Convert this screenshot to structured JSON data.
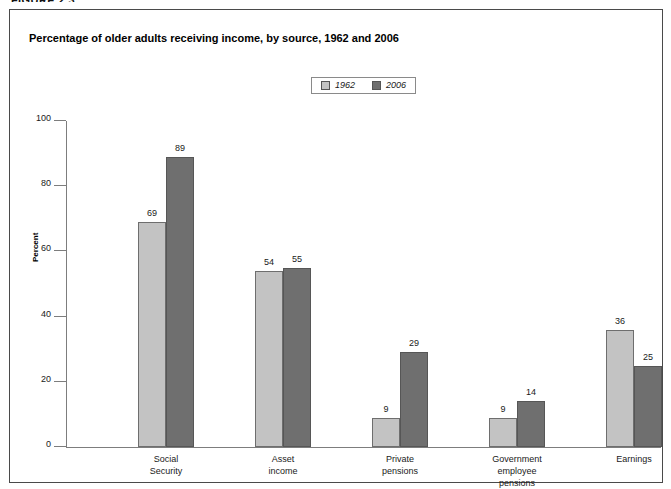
{
  "figure_heading": "FIGURE 2.3",
  "chart_title": "Percentage of older adults receiving income, by source, 1962 and 2006",
  "legend": {
    "entries": [
      {
        "label": "1962",
        "color": "#c3c3c3"
      },
      {
        "label": "2006",
        "color": "#6f6f6f"
      }
    ]
  },
  "chart_data": {
    "type": "bar",
    "title": "Percentage of older adults receiving income, by source, 1962 and 2006",
    "xlabel": "",
    "ylabel": "Percent",
    "ylim": [
      0,
      100
    ],
    "yticks": [
      0,
      20,
      40,
      60,
      80,
      100
    ],
    "grid": false,
    "legend_position": "top-center",
    "categories": [
      "Social Security",
      "Asset income",
      "Private pensions",
      "Government employee pensions",
      "Earnings"
    ],
    "category_lines": [
      [
        "Social",
        "Security"
      ],
      [
        "Asset",
        "income"
      ],
      [
        "Private",
        "pensions"
      ],
      [
        "Government",
        "employee",
        "pensions"
      ],
      [
        "Earnings"
      ]
    ],
    "series": [
      {
        "name": "1962",
        "color": "#c3c3c3",
        "values": [
          69,
          54,
          9,
          9,
          36
        ]
      },
      {
        "name": "2006",
        "color": "#6f6f6f",
        "values": [
          89,
          55,
          29,
          14,
          25
        ]
      }
    ]
  }
}
